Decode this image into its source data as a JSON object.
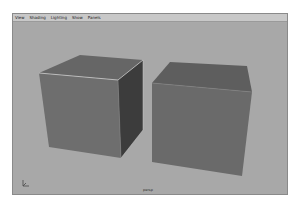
{
  "menubar": {
    "items": [
      {
        "label": "View"
      },
      {
        "label": "Shading"
      },
      {
        "label": "Lighting"
      },
      {
        "label": "Show"
      },
      {
        "label": "Panels"
      }
    ]
  },
  "viewport": {
    "camera_label": "persp",
    "background_color": "#a8a8a8",
    "objects": [
      {
        "name": "cube-left",
        "selected": true
      },
      {
        "name": "cube-right",
        "selected": false
      }
    ]
  }
}
